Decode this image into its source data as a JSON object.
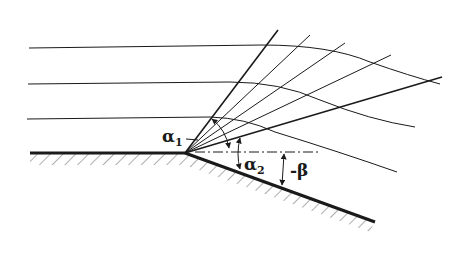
{
  "figure": {
    "labels": {
      "alpha1": "α",
      "alpha1_sub": "1",
      "alpha2": "α",
      "alpha2_sub": "2",
      "beta": "-β"
    },
    "colors": {
      "ink": "#1a1a1a",
      "background": "#ffffff"
    },
    "corner": {
      "x": 185,
      "y": 153
    },
    "streamline_count": 3,
    "expansion_wave_count": 6
  }
}
